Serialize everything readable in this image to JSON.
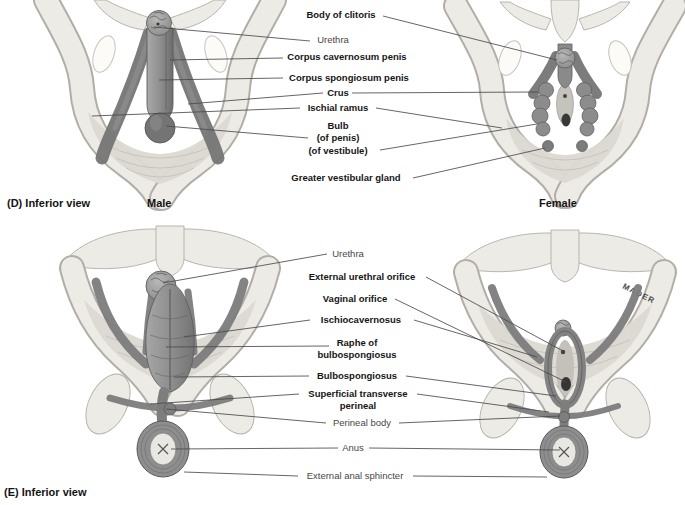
{
  "figure": {
    "signature": "MADER",
    "colors": {
      "background": "#ffffff",
      "bone_fill": "#edebe5",
      "bone_outline": "#b2aea7",
      "membrane": "#dcd8d2",
      "tissue_mid": "#8e8e8e",
      "tissue_dark": "#6e6e6e",
      "leader_line": "#4a4a4a",
      "label_bold": "#161616",
      "label_plain": "#474747"
    },
    "panel_d": {
      "caption": "(D) Inferior view",
      "male_caption": "Male",
      "female_caption": "Female",
      "labels": {
        "body_of_clitoris": "Body of clitoris",
        "urethra": "Urethra",
        "corpus_cavernosum_penis": "Corpus cavernosum penis",
        "corpus_spongiosum_penis": "Corpus spongiosum penis",
        "crus": "Crus",
        "ischial_ramus": "Ischial ramus",
        "bulb_line1": "Bulb",
        "bulb_line2": "(of penis)",
        "bulb_line3": "(of vestibule)",
        "greater_vestibular_gland": "Greater vestibular gland"
      }
    },
    "panel_e": {
      "caption": "(E) Inferior view",
      "labels": {
        "urethra": "Urethra",
        "external_urethral_orifice": "External urethral orifice",
        "vaginal_orifice": "Vaginal orifice",
        "ischiocavernosus": "Ischiocavernosus",
        "raphe_line1": "Raphe of",
        "raphe_line2": "bulbospongiosus",
        "bulbospongiosus": "Bulbospongiosus",
        "superficial_transverse_line1": "Superficial transverse",
        "superficial_transverse_line2": "perineal",
        "perineal_body": "Perineal body",
        "anus": "Anus",
        "external_anal_sphincter": "External anal sphincter"
      }
    }
  }
}
